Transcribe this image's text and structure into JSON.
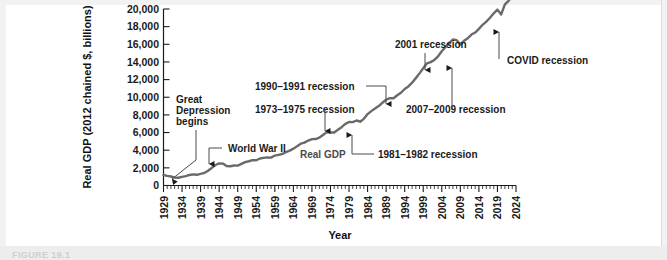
{
  "figure": {
    "caption": "FIGURE 19.1"
  },
  "chart_data": {
    "type": "line",
    "title": "",
    "xlabel": "Year",
    "ylabel": "Real GDP (2012 chained $, billions)",
    "series_label": "Real GDP",
    "xlim": [
      1929,
      2024
    ],
    "ylim": [
      0,
      20000
    ],
    "grid": false,
    "legend_position": "inline-annotation",
    "ytick_labels": [
      "0",
      "2,000",
      "4,000",
      "6,000",
      "8,000",
      "10,000",
      "12,000",
      "14,000",
      "16,000",
      "18,000",
      "20,000"
    ],
    "ytick_values": [
      0,
      2000,
      4000,
      6000,
      8000,
      10000,
      12000,
      14000,
      16000,
      18000,
      20000
    ],
    "xtick_labels": [
      "1929",
      "1934",
      "1939",
      "1944",
      "1949",
      "1954",
      "1959",
      "1964",
      "1969",
      "1974",
      "1979",
      "1984",
      "1989",
      "1994",
      "1999",
      "2004",
      "2009",
      "2014",
      "2019",
      "2024"
    ],
    "xtick_values": [
      1929,
      1934,
      1939,
      1944,
      1949,
      1954,
      1959,
      1964,
      1969,
      1974,
      1979,
      1984,
      1989,
      1994,
      1999,
      2004,
      2009,
      2014,
      2019,
      2024
    ],
    "x": [
      1929,
      1930,
      1931,
      1932,
      1933,
      1934,
      1935,
      1936,
      1937,
      1938,
      1939,
      1940,
      1941,
      1942,
      1943,
      1944,
      1945,
      1946,
      1947,
      1948,
      1949,
      1950,
      1951,
      1952,
      1953,
      1954,
      1955,
      1956,
      1957,
      1958,
      1959,
      1960,
      1961,
      1962,
      1963,
      1964,
      1965,
      1966,
      1967,
      1968,
      1969,
      1970,
      1971,
      1972,
      1973,
      1974,
      1975,
      1976,
      1977,
      1978,
      1979,
      1980,
      1981,
      1982,
      1983,
      1984,
      1985,
      1986,
      1987,
      1988,
      1989,
      1990,
      1991,
      1992,
      1993,
      1994,
      1995,
      1996,
      1997,
      1998,
      1999,
      2000,
      2001,
      2002,
      2003,
      2004,
      2005,
      2006,
      2007,
      2008,
      2009,
      2010,
      2011,
      2012,
      2013,
      2014,
      2015,
      2016,
      2017,
      2018,
      2019,
      2020,
      2021,
      2022,
      2023,
      2024
    ],
    "y": [
      1191,
      1090,
      1020,
      888,
      876,
      971,
      1057,
      1194,
      1256,
      1213,
      1311,
      1424,
      1676,
      1991,
      2324,
      2509,
      2481,
      2198,
      2178,
      2268,
      2256,
      2453,
      2650,
      2750,
      2877,
      2860,
      3063,
      3128,
      3189,
      3162,
      3393,
      3477,
      3565,
      3782,
      3949,
      4177,
      4444,
      4735,
      4863,
      5095,
      5253,
      5263,
      5435,
      5722,
      6044,
      6012,
      5998,
      6322,
      6612,
      6978,
      7200,
      7183,
      7364,
      7226,
      7554,
      8094,
      8428,
      8717,
      9004,
      9376,
      9717,
      9893,
      9884,
      10225,
      10507,
      10935,
      11224,
      11649,
      12167,
      12705,
      13290,
      13841,
      13984,
      14228,
      14643,
      15207,
      15702,
      16149,
      16543,
      16466,
      15992,
      16401,
      16684,
      17105,
      17333,
      17746,
      18208,
      18566,
      19005,
      19511,
      19929,
      19385,
      20512,
      20919,
      21500,
      21900
    ],
    "annotations": [
      {
        "name": "great-depression",
        "label": "Great\nDepression\nbegins",
        "target_year": 1930,
        "target_value": 1100
      },
      {
        "name": "world-war-ii",
        "label": "World War II",
        "target_year": 1944,
        "target_value": 2509
      },
      {
        "name": "recession-1973-1975",
        "label": "1973–1975 recession",
        "target_year": 1974,
        "target_value": 6012
      },
      {
        "name": "recession-1981-1982",
        "label": "1981–1982 recession",
        "target_year": 1982,
        "target_value": 7226
      },
      {
        "name": "recession-1990-1991",
        "label": "1990–1991 recession",
        "target_year": 1991,
        "target_value": 9884
      },
      {
        "name": "recession-2001",
        "label": "2001 recession",
        "target_year": 2001,
        "target_value": 13984
      },
      {
        "name": "recession-2007-2009",
        "label": "2007–2009 recession",
        "target_year": 2009,
        "target_value": 15992
      },
      {
        "name": "covid",
        "label": "COVID recession",
        "target_year": 2020,
        "target_value": 19385
      }
    ],
    "colors": {
      "line": "#6a6a6a",
      "axis": "#1a1a1a",
      "text": "#1a1a1a",
      "annotation_leader": "#4a4a4a",
      "background": "#ffffff"
    }
  }
}
